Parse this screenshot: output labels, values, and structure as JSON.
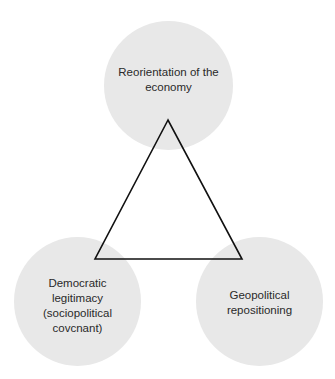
{
  "diagram": {
    "type": "triangle-of-three-concepts",
    "nodes": [
      {
        "id": "top",
        "label": "Reorientation of the economy"
      },
      {
        "id": "bottom-left",
        "label": "Democratic legitimacy (sociopolitical covcnant)"
      },
      {
        "id": "bottom-right",
        "label": "Geopolitical repositioning"
      }
    ],
    "edges": [
      {
        "from": "top",
        "to": "bottom-left"
      },
      {
        "from": "bottom-left",
        "to": "bottom-right"
      },
      {
        "from": "bottom-right",
        "to": "top"
      }
    ],
    "colors": {
      "node_fill": "#e8e8e8",
      "edge_stroke": "#111111",
      "text": "#2a2a2a"
    },
    "caption_visible": "truncated at image edge (illegible)"
  }
}
